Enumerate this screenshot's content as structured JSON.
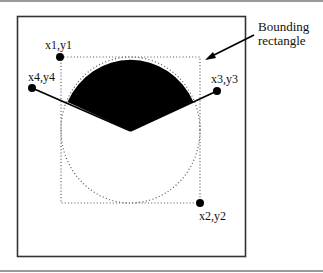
{
  "figure": {
    "labels": {
      "p1": "x1,y1",
      "p2": "x2,y2",
      "p3": "x3,y3",
      "p4": "x4,y4",
      "callout_line1": "Bounding",
      "callout_line2": "rectangle"
    },
    "colors": {
      "ink": "#000000",
      "dotted": "#555555",
      "rule": "#9a9a9a",
      "frame": "#333333"
    }
  }
}
